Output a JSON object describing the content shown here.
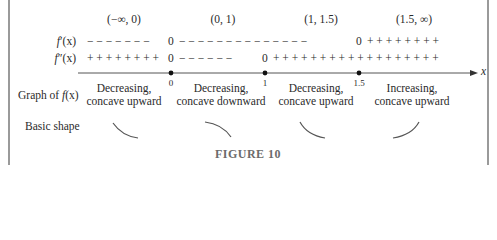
{
  "figure": {
    "caption": "FIGURE 10",
    "intervals": [
      "(−∞, 0)",
      "(0, 1)",
      "(1, 1.5)",
      "(1.5, ∞)"
    ],
    "rows": {
      "f_prime": {
        "label_fn": "f",
        "label_mark": "′",
        "label_arg": "(x)",
        "segments": [
          "− − − − − − −",
          "0",
          "− − − − − − − − − − − − − −",
          "0",
          "+ + + + + + + +"
        ]
      },
      "f_double_prime": {
        "label_fn": "f",
        "label_mark": "″",
        "label_arg": "(x)",
        "segments": [
          "+ + + + + + + +",
          "0",
          "− − − − − −",
          "0",
          "+ + + + + + + + + + + + + + + + + +"
        ]
      }
    },
    "axis": {
      "variable": "x",
      "ticks": [
        "0",
        "1",
        "1.5"
      ]
    },
    "graph_row": {
      "label_prefix": "Graph of ",
      "label_fn": "f",
      "label_arg": "(x)",
      "descriptions": [
        {
          "line1": "Decreasing,",
          "line2": "concave upward"
        },
        {
          "line1": "Decreasing,",
          "line2": "concave downward"
        },
        {
          "line1": "Decreasing,",
          "line2": "concave upward"
        },
        {
          "line1": "Increasing,",
          "line2": "concave upward"
        }
      ]
    },
    "shape_row": {
      "label": "Basic shape",
      "shapes": [
        "decreasing-concave-up-arc",
        "decreasing-concave-down-arc",
        "decreasing-concave-up-arc",
        "increasing-concave-up-arc"
      ]
    },
    "colors": {
      "text": "#2a2a2a",
      "axis": "#555555",
      "frame": "#9a9a9a",
      "caption": "#6b6b6b",
      "curves": "#555555"
    }
  }
}
